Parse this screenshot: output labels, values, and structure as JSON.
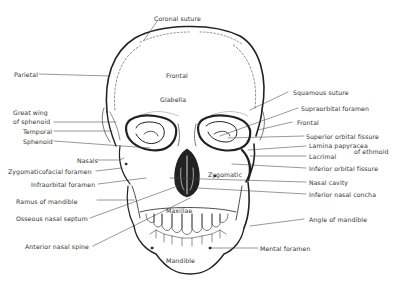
{
  "diagram": {
    "labels_inside": {
      "frontal": "Frontal",
      "glabella": "Glabella",
      "maxillae": "Maxillae",
      "mandible": "Mandible",
      "zygomatic": "Zygomatic"
    },
    "labels_top": {
      "coronal_suture": "Coronal suture"
    },
    "labels_left": [
      "Parietal",
      "Great wing",
      "of sphenoid",
      "Temporal",
      "Sphenoid",
      "Nasals",
      "Zygomaticofacial foramen",
      "Infraorbital foramen",
      "Ramus of mandible",
      "Osseous nasal septum",
      "Anterior nasal spine"
    ],
    "labels_right": [
      "Squamous suture",
      "Supraorbital foramen",
      "Frontal",
      "Superior orbital fissure",
      "Lamina papyracea",
      "of ethmoid",
      "Lacrimal",
      "Inferior orbital fissure",
      "Nasal cavity",
      "Inferior nasal concha",
      "Angle of mandible",
      "Mental foramen"
    ],
    "colors": {
      "line": "#222222",
      "text": "#333333",
      "background": "#ffffff"
    }
  }
}
